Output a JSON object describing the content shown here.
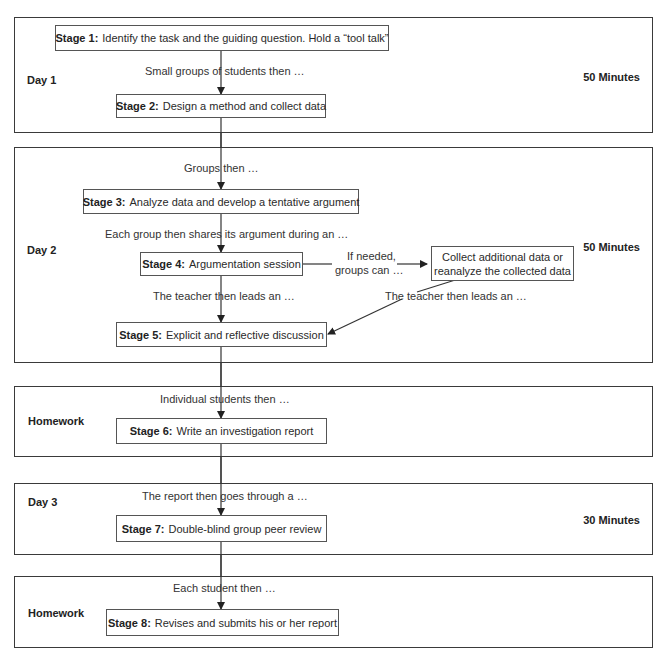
{
  "diagram": {
    "sections": [
      {
        "label": "Day 1",
        "duration": "50 Minutes"
      },
      {
        "label": "Day 2",
        "duration": "50 Minutes"
      },
      {
        "label": "Homework",
        "duration": ""
      },
      {
        "label": "Day 3",
        "duration": "30 Minutes"
      },
      {
        "label": "Homework",
        "duration": ""
      }
    ],
    "stages": [
      {
        "num": "Stage 1:",
        "text": "Identify the task and the guiding question. Hold a “tool talk”"
      },
      {
        "num": "Stage 2:",
        "text": "Design a method and collect data"
      },
      {
        "num": "Stage 3:",
        "text": "Analyze data and develop a tentative argument"
      },
      {
        "num": "Stage 4:",
        "text": "Argumentation session"
      },
      {
        "num": "Stage 5:",
        "text": "Explicit and reflective discussion"
      },
      {
        "num": "Stage 6:",
        "text": "Write an investigation report"
      },
      {
        "num": "Stage 7:",
        "text": "Double-blind group peer review"
      },
      {
        "num": "Stage 8:",
        "text": "Revises and submits his or her report"
      }
    ],
    "connectors": [
      "Small groups of students then …",
      "Groups then …",
      "Each group then shares its argument during an …",
      "The teacher then leads an …",
      "Individual students then …",
      "The report then goes through a …",
      "Each student then …"
    ],
    "side_branch": {
      "condition_line1": "If needed,",
      "condition_line2": "groups can …",
      "box_line1": "Collect additional data or",
      "box_line2": "reanalyze the collected data",
      "return_label": "The teacher then leads an …"
    },
    "colors": {
      "line": "#333333",
      "frame": "#3a3a3a",
      "text": "#2a2a2a"
    }
  }
}
